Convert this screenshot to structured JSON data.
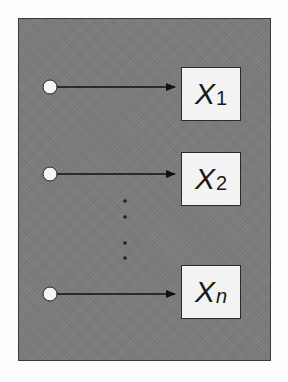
{
  "diagram": {
    "background_color": "#7d7d7d",
    "rows": [
      {
        "symbol": "X",
        "subscript": "1",
        "y": 87,
        "box_top": 67
      },
      {
        "symbol": "X",
        "subscript": "2",
        "y": 174,
        "box_top": 152
      },
      {
        "symbol": "X",
        "subscript": "n",
        "y": 294,
        "box_top": 265
      }
    ],
    "ellipsis_dots": 4,
    "ellipsis_label": "vertical dots (continuation)"
  }
}
